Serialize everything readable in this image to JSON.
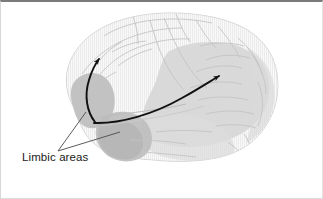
{
  "figure": {
    "kind": "anatomical-diagram",
    "width": 323,
    "height": 199,
    "background_color": "#ffffff",
    "frame": {
      "top_border_color": "#7b7b7b",
      "side_border_color": "#dcdcdc"
    }
  },
  "labels": {
    "limbic_areas": "Limbic areas"
  },
  "regions": [
    {
      "id": "limbic-frontal-patch",
      "name": "Limbic areas (orbitofrontal / frontal)",
      "fill": "#b9b9b9",
      "opacity": 0.85
    },
    {
      "id": "limbic-temporal-pole-patch",
      "name": "Limbic areas (temporal pole)",
      "fill": "#b9b9b9",
      "opacity": 0.85
    },
    {
      "id": "association-parietal-patch",
      "name": "Posterior association area (shaded)",
      "fill": "#cfcfcf",
      "opacity": 0.8
    },
    {
      "id": "cortex-body",
      "name": "Cerebral cortex body",
      "fill": "#f1f1f1",
      "opacity": 1
    }
  ],
  "arrows": [
    {
      "id": "arrow-limbic-to-frontal",
      "name": "arrow from limbic origin to frontal cortex",
      "from": [
        95,
        121
      ],
      "to": [
        99,
        57
      ],
      "color": "#111111"
    },
    {
      "id": "arrow-limbic-to-parietal",
      "name": "arrow from limbic origin to posterior association cortex",
      "from": [
        95,
        121
      ],
      "to": [
        222,
        73
      ],
      "color": "#111111"
    }
  ],
  "leader_lines": [
    {
      "id": "leader-to-frontal-limbic",
      "from": [
        58,
        152
      ],
      "to": [
        85,
        113
      ],
      "color": "#444444"
    },
    {
      "id": "leader-to-temporal-limbic",
      "from": [
        58,
        152
      ],
      "to": [
        118,
        133
      ],
      "color": "#444444"
    }
  ],
  "colors": {
    "ink": "#111111",
    "cortex_light": "#f1f1f1",
    "cortex_outline": "#d2d2d2",
    "shaded_light": "#d2d2d2",
    "shaded_dark": "#b9b9b9",
    "text": "#1b1b1b"
  }
}
